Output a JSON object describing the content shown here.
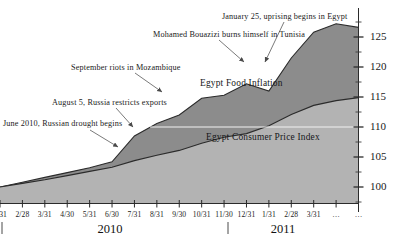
{
  "chart_data": {
    "type": "area",
    "title": "",
    "xlabel": "",
    "ylabel": "",
    "ylim": [
      96,
      129
    ],
    "grid": false,
    "legend_position": "inline",
    "y_ticks": [
      100,
      105,
      110,
      115,
      120,
      125
    ],
    "y_minor_ticks": [
      97.5,
      102.5,
      107.5,
      112.5,
      117.5,
      122.5,
      127.5
    ],
    "y_axis_side": "right",
    "categories": [
      "1/31",
      "2/28",
      "3/31",
      "4/30",
      "5/31",
      "6/30",
      "7/31",
      "8/31",
      "9/30",
      "10/31",
      "11/30",
      "12/31",
      "1/31",
      "2/28",
      "3/31",
      "…",
      "…"
    ],
    "year_groups": [
      {
        "label": "2010",
        "start": "1/31",
        "end": "12/31"
      },
      {
        "label": "2011",
        "start": "1/31",
        "end": "…"
      }
    ],
    "series": [
      {
        "name": "Egypt Food Inflation",
        "color": "#8c8c8c",
        "values": [
          100.0,
          100.8,
          101.6,
          102.4,
          103.2,
          104.2,
          108.5,
          110.6,
          112.0,
          114.8,
          115.3,
          117.2,
          116.0,
          121.5,
          125.8,
          127.2,
          126.6
        ]
      },
      {
        "name": "Egypt Consumer Price Index",
        "color": "#b3b3b3",
        "values": [
          100.0,
          100.6,
          101.2,
          101.9,
          102.6,
          103.3,
          104.4,
          105.3,
          106.1,
          107.3,
          108.3,
          108.9,
          110.2,
          112.1,
          113.6,
          114.4,
          114.9
        ]
      }
    ],
    "annotations": [
      {
        "text": "June 2010, Russian drought begins",
        "label_x": 3,
        "label_y": 119,
        "arrow_from_x": 90,
        "arrow_from_y": 130,
        "arrow_to_x": 118,
        "arrow_to_y": 147
      },
      {
        "text": "August 5, Russia restricts exports",
        "label_x": 52,
        "label_y": 98,
        "arrow_from_x": 116,
        "arrow_from_y": 108,
        "arrow_to_x": 133,
        "arrow_to_y": 127
      },
      {
        "text": "September riots in Mozambique",
        "label_x": 71,
        "label_y": 63,
        "arrow_from_x": 135,
        "arrow_from_y": 73,
        "arrow_to_x": 162,
        "arrow_to_y": 92
      },
      {
        "text": "Mohamed Bouazizi burns himself in Tunisia",
        "label_x": 153,
        "label_y": 30,
        "arrow_from_x": 219,
        "arrow_from_y": 40,
        "arrow_to_x": 244,
        "arrow_to_y": 62
      },
      {
        "text": "January 25, uprising begins in Egypt",
        "label_x": 222,
        "label_y": 12,
        "arrow_from_x": 284,
        "arrow_from_y": 22,
        "arrow_to_x": 265,
        "arrow_to_y": 62
      }
    ],
    "reference_line": {
      "value": 110,
      "color": "#f2f2f2"
    }
  }
}
